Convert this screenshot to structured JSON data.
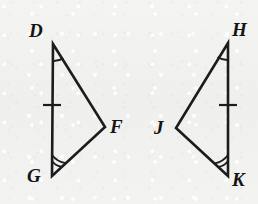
{
  "figure": {
    "kind": "geometry-diagram",
    "background_color": "#f1f1f0",
    "ink_color": "#1c1c1c",
    "canvas": {
      "width": 258,
      "height": 204
    },
    "triangles": [
      {
        "id": "left-triangle",
        "name": "triangle-DFG",
        "vertices": [
          {
            "label": "D",
            "x": 53,
            "y": 44,
            "label_x": 29,
            "label_y": 21,
            "marking": "single-angle-arc"
          },
          {
            "label": "F",
            "x": 105,
            "y": 127,
            "label_x": 110,
            "label_y": 117,
            "marking": "none"
          },
          {
            "label": "G",
            "x": 52,
            "y": 176,
            "label_x": 27,
            "label_y": 166,
            "marking": "double-angle-arc"
          }
        ],
        "side_markings": [
          {
            "side": "DG",
            "marks": 1,
            "tick_x": 52,
            "tick_y": 105
          }
        ]
      },
      {
        "id": "right-triangle",
        "name": "triangle-HJK",
        "vertices": [
          {
            "label": "H",
            "x": 228,
            "y": 43,
            "label_x": 232,
            "label_y": 20,
            "marking": "single-angle-arc"
          },
          {
            "label": "J",
            "x": 176,
            "y": 128,
            "label_x": 154,
            "label_y": 118,
            "marking": "none"
          },
          {
            "label": "K",
            "x": 228,
            "y": 176,
            "label_x": 232,
            "label_y": 170,
            "marking": "double-angle-arc"
          }
        ],
        "side_markings": [
          {
            "side": "HK",
            "marks": 1,
            "tick_x": 228,
            "tick_y": 105
          }
        ]
      }
    ]
  }
}
